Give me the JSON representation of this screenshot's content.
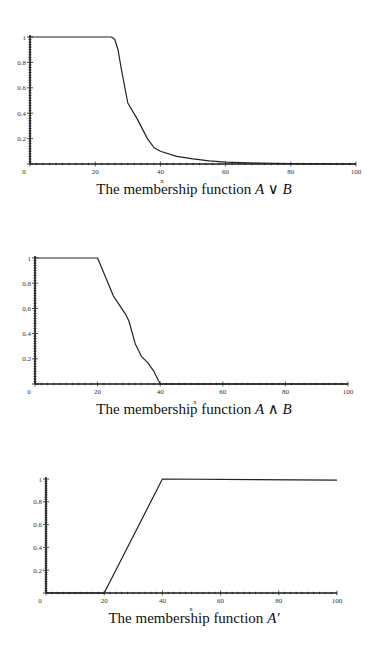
{
  "chart_data": [
    {
      "type": "line",
      "title": "",
      "caption": "The membership function",
      "caption_math": "A ∨ B",
      "xlabel": "x",
      "ylabel": "",
      "xlim": [
        0,
        100
      ],
      "ylim": [
        0,
        1
      ],
      "xticks": [
        "0",
        "20",
        "40",
        "60",
        "80",
        "100"
      ],
      "yticks": [
        "0.2",
        "0.4",
        "0.6",
        "0.8",
        "1"
      ],
      "grid": false,
      "x": [
        0,
        25,
        26,
        27,
        28,
        30,
        33,
        36,
        38,
        40,
        45,
        50,
        55,
        60,
        70,
        80,
        90,
        100
      ],
      "values": [
        1,
        1,
        0.98,
        0.9,
        0.75,
        0.48,
        0.35,
        0.2,
        0.13,
        0.1,
        0.06,
        0.04,
        0.025,
        0.015,
        0.007,
        0.003,
        0.001,
        0.0
      ],
      "layout": {
        "x0": 30,
        "y0": 164,
        "sx": 3.26,
        "sy": 127,
        "capY": 194,
        "xlabelX": 162,
        "xlabelY": 177
      }
    },
    {
      "type": "line",
      "title": "",
      "caption": "The membership function",
      "caption_math": "A ∧ B",
      "xlabel": "x",
      "ylabel": "",
      "xlim": [
        0,
        100
      ],
      "ylim": [
        0,
        1
      ],
      "xticks": [
        "0",
        "20",
        "40",
        "60",
        "80",
        "100"
      ],
      "yticks": [
        "0.2",
        "0.4",
        "0.6",
        "0.8",
        "1"
      ],
      "grid": false,
      "x": [
        0,
        20,
        25,
        29,
        30,
        32,
        34,
        36,
        38,
        40,
        100
      ],
      "values": [
        1,
        1,
        0.7,
        0.55,
        0.5,
        0.32,
        0.22,
        0.17,
        0.1,
        0,
        0
      ],
      "layout": {
        "x0": 35,
        "y0": 384,
        "sx": 3.13,
        "sy": 126,
        "capY": 414,
        "xlabelX": 195,
        "xlabelY": 398
      }
    },
    {
      "type": "line",
      "title": "",
      "caption": "The membership function",
      "caption_math": "A′",
      "xlabel": "x",
      "ylabel": "",
      "xlim": [
        0,
        100
      ],
      "ylim": [
        0,
        1
      ],
      "xticks": [
        "0",
        "20",
        "40",
        "60",
        "80",
        "100"
      ],
      "yticks": [
        "0.2",
        "0.4",
        "0.6",
        "0.8",
        "1"
      ],
      "grid": false,
      "x": [
        0,
        20,
        40,
        100
      ],
      "values": [
        0,
        0,
        1,
        0.99
      ],
      "layout": {
        "x0": 46,
        "y0": 593,
        "sx": 2.91,
        "sy": 114,
        "capY": 623,
        "xlabelX": 191,
        "xlabelY": 605
      }
    }
  ],
  "colors": {
    "line": "#222222",
    "axis": "#1a1a1a",
    "background": "#ffffff"
  }
}
